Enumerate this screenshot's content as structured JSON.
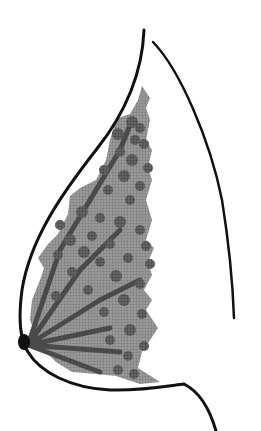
{
  "figure": {
    "title": "Breast anatomy side profile illustration",
    "colors": {
      "outline": "#111111",
      "tissue": "#8f8f8f",
      "lobule": "#5a5a5a",
      "duct": "#555555",
      "nipple": "#111111",
      "background": "#ffffff"
    },
    "elements": [
      "skin-outline",
      "chest-wall-line",
      "glandular-tissue",
      "lobules",
      "ducts",
      "nipple"
    ]
  }
}
